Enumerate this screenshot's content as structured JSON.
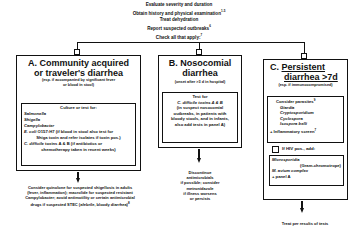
{
  "header": {
    "lines": [
      {
        "text": "Evaluate severity  and duration",
        "sup": ""
      },
      {
        "text": "Obtain history and physical examination",
        "sup": "1-5"
      },
      {
        "text": "Treat dehydration",
        "sup": ""
      },
      {
        "text": "Report suspected  outbreaks",
        "sup": "6"
      },
      {
        "text": "Check all that apply:",
        "sup": "7"
      }
    ]
  },
  "panel_a": {
    "title_line1": "A. Community acquired",
    "title_line2": "or traveler's diarrhea",
    "subtitle_line1": "(esp. if accompanied by significant fever",
    "subtitle_line2": "or blood in stool)",
    "inner": {
      "heading": "Culture or test for:",
      "items": [
        "Salmonella",
        "Shigella",
        "Campylobacter"
      ],
      "ecoli_name": "E. coli",
      "ecoli_rest": " O157:H7  (if blood in stool also test for",
      "ecoli_line2": "Shiga toxin and refer isolates if toxin pos.)",
      "cdiff_name": "C. difficile",
      "cdiff_rest": " toxins A & B  (if antibiotics or",
      "cdiff_line2": "chemotherapy taken in recent weeks)"
    },
    "note_lines": [
      "Consider quinolone for suspected shigellosis in adults",
      "(fever, inflammation); macrolide for suspected resistant",
      "Campylobacter; avoid antimotility or certain antimicrobial",
      "drugs if suspected STEC (afebrile, bloody diarrhea)"
    ],
    "note_sup": "8"
  },
  "panel_b": {
    "title_line1": "B. Nosocomial",
    "title_line2": "diarrhea",
    "subtitle": "(onset after >3 d in hospital)",
    "inner": {
      "line1": "Test for",
      "cdiff": "C. difficile toxins A & B",
      "lines": [
        "(in suspect nosocomial",
        "outbreaks, in patients with",
        "bloody stools, and  in infants,",
        "also add tests in panel A)"
      ]
    },
    "note_lines": [
      "Discontinue",
      "antimicrobials",
      "if possible;  consider",
      "metronidazole",
      "if illness worsens",
      "or persists"
    ]
  },
  "panel_c": {
    "title_prefix": "C. ",
    "title_line1": "Persistent",
    "title_line2": "diarrhea >7d",
    "subtitle": "(esp. if immunocompromised)",
    "inner": {
      "heading": "Consider parasites",
      "heading_sup": "9",
      "items": [
        "Giardia",
        "Cryptosporidium",
        "Cyclospora",
        "Isospora belli"
      ],
      "inflammatory": "+ Inflammatory screen",
      "inflammatory_sup": "7"
    },
    "hiv_label": "If HIV pos., add:",
    "hiv_box": {
      "line1": "Microsporidia",
      "line2": "(Gram-chromotrope)",
      "line3": "M. avium complex",
      "line4": "+ panel A"
    },
    "note": "Treat per results of tests"
  }
}
